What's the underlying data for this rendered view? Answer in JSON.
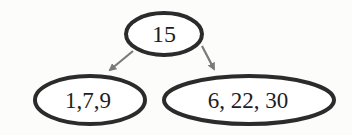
{
  "diagram": {
    "type": "tree",
    "colors": {
      "node_stroke": "#2b2b2b",
      "edge": "#7a7a7a",
      "text": "#1e1e1e",
      "background": "#fcfcfb"
    },
    "nodes": [
      {
        "id": "root",
        "label": "15"
      },
      {
        "id": "left",
        "label": "1,7,9"
      },
      {
        "id": "right",
        "label": "6, 22, 30"
      }
    ],
    "edges": [
      {
        "from": "root",
        "to": "left"
      },
      {
        "from": "root",
        "to": "right"
      }
    ]
  }
}
